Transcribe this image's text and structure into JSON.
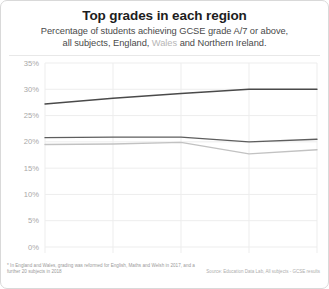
{
  "card": {
    "title": "Top grades in each region",
    "subtitle_line1": "Percentage of students achieving GCSE grade A/7 or above,",
    "subtitle_line2_a": "all subjects, England, ",
    "subtitle_line2_wales": "Wales",
    "subtitle_line2_b": " and Northern Ireland.",
    "footnote": "* In England and Wales, grading was reformed for English, Maths and Welsh in 2017, and a further 20 subjects in 2018",
    "source": "Source: Education Data Lab, All subjects - GCSE results"
  },
  "chart_data": {
    "type": "line",
    "title": "Top grades in each region",
    "subtitle": "Percentage of students achieving GCSE grade A/7 or above, all subjects, England, Wales and Northern Ireland.",
    "xlabel": "",
    "ylabel": "",
    "categories": [
      "2014",
      "2015",
      "2016",
      "2017",
      "2018"
    ],
    "x": [
      2014,
      2015,
      2016,
      2017,
      2018
    ],
    "ylim": [
      0,
      35
    ],
    "yticks": [
      0,
      5,
      10,
      15,
      20,
      25,
      30,
      35
    ],
    "ytick_labels": [
      "0%",
      "5%",
      "10%",
      "15%",
      "20%",
      "25%",
      "30%",
      "35%"
    ],
    "grid": true,
    "legend": "none",
    "series": [
      {
        "name": "Northern Ireland",
        "color": "#4a4a4a",
        "values": [
          27.2,
          28.3,
          29.2,
          30.0,
          30.0
        ]
      },
      {
        "name": "England",
        "color": "#5e5e5e",
        "values": [
          20.8,
          20.9,
          20.9,
          20.0,
          20.5
        ]
      },
      {
        "name": "Wales",
        "color": "#c2c2c2",
        "values": [
          19.5,
          19.6,
          19.9,
          17.7,
          18.5
        ]
      }
    ]
  },
  "colors": {
    "dark_line": "#4a4a4a",
    "mid_line": "#5e5e5e",
    "light_line": "#c2c2c2",
    "grid": "#ededed",
    "axis_text": "#a8a8a8",
    "border": "#d9d9d9"
  }
}
